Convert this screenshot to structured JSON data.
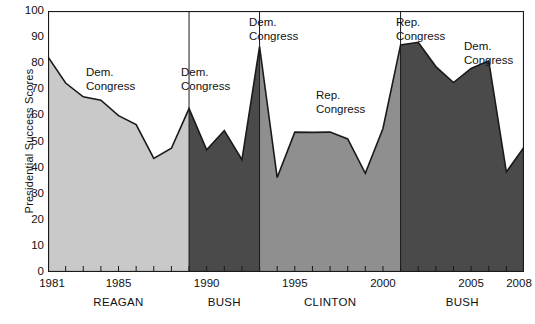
{
  "chart_data": {
    "type": "area",
    "title": "",
    "xlabel": "",
    "ylabel": "Presidential Success Scores",
    "ylim": [
      0,
      100
    ],
    "xlim": [
      1981,
      2008
    ],
    "yticks": [
      0,
      10,
      20,
      30,
      40,
      50,
      60,
      70,
      80,
      90,
      100
    ],
    "xticks": [
      1981,
      1985,
      1990,
      1995,
      2000,
      2005,
      2008
    ],
    "grid": false,
    "legend": "none",
    "x": [
      1981,
      1982,
      1983,
      1984,
      1985,
      1986,
      1987,
      1988,
      1989,
      1990,
      1991,
      1992,
      1993,
      1994,
      1995,
      1996,
      1997,
      1998,
      1999,
      2000,
      2001,
      2002,
      2003,
      2004,
      2005,
      2006,
      2007,
      2008
    ],
    "values": [
      82.4,
      72.4,
      67.1,
      65.8,
      59.9,
      56.5,
      43.5,
      47.4,
      62.6,
      46.8,
      54.2,
      43.0,
      86.4,
      36.2,
      53.6,
      53.5,
      53.6,
      51.0,
      37.8,
      55.0,
      87.0,
      88.0,
      78.7,
      72.6,
      78.0,
      80.9,
      38.3,
      47.8
    ],
    "series_note": "Presidential success scores on congressional roll-call votes, 1981-2008",
    "segments": [
      {
        "president": "REAGAN",
        "start_year": 1981,
        "end_year": 1989,
        "fill": "#c9c9c9"
      },
      {
        "president": "BUSH",
        "start_year": 1989,
        "end_year": 1993,
        "fill": "#4a4a4a"
      },
      {
        "president": "CLINTON",
        "start_year": 1993,
        "end_year": 2001,
        "fill": "#8f8f8f"
      },
      {
        "president": "BUSH",
        "start_year": 2001,
        "end_year": 2008,
        "fill": "#4a4a4a"
      }
    ],
    "annotations": [
      {
        "text_line1": "Dem.",
        "text_line2": "Congress",
        "x_px": 86,
        "y_px": 66
      },
      {
        "text_line1": "Dem.",
        "text_line2": "Congress",
        "x_px": 181,
        "y_px": 66
      },
      {
        "text_line1": "Dem.",
        "text_line2": "Congress",
        "x_px": 249,
        "y_px": 16
      },
      {
        "text_line1": "Rep.",
        "text_line2": "Congress",
        "x_px": 316,
        "y_px": 89
      },
      {
        "text_line1": "Rep.",
        "text_line2": "Congress",
        "x_px": 396,
        "y_px": 16
      },
      {
        "text_line1": "Dem.",
        "text_line2": "Congress",
        "x_px": 464,
        "y_px": 40
      }
    ],
    "colors": {
      "fill_light": "#c9c9c9",
      "fill_mid": "#8f8f8f",
      "fill_dark": "#4a4a4a",
      "line": "#1a1a1a",
      "axis": "#1a1a1a",
      "background": "#ffffff"
    }
  },
  "axis": {
    "y_label": "Presidential Success Scores",
    "y_ticks": [
      "100",
      "90",
      "80",
      "70",
      "60",
      "50",
      "40",
      "30",
      "20",
      "10",
      "0"
    ],
    "x_ticks": [
      "1981",
      "1985",
      "1990",
      "1995",
      "2000",
      "2005",
      "2008"
    ]
  },
  "presidents": [
    {
      "name": "REAGAN"
    },
    {
      "name": "BUSH"
    },
    {
      "name": "CLINTON"
    },
    {
      "name": "BUSH"
    }
  ],
  "annotations": [
    {
      "line1": "Dem.",
      "line2": "Congress"
    },
    {
      "line1": "Dem.",
      "line2": "Congress"
    },
    {
      "line1": "Dem.",
      "line2": "Congress"
    },
    {
      "line1": "Rep.",
      "line2": "Congress"
    },
    {
      "line1": "Rep.",
      "line2": "Congress"
    },
    {
      "line1": "Dem.",
      "line2": "Congress"
    }
  ]
}
